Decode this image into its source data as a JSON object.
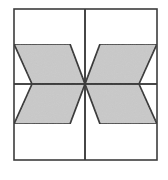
{
  "figure": {
    "background_color": "#ffffff",
    "frame": {
      "name": "square-border",
      "stroke_color": "#3c3c3c",
      "stroke_width": 1.6,
      "fill_color": "#ffffff",
      "left": 14,
      "top": 9,
      "right": 157,
      "bottom": 160
    },
    "grid": {
      "stroke_color": "#3c3c3c",
      "stroke_width": 1.6,
      "vertical_line_x": 85,
      "horizontal_line_y": 84
    },
    "center_point": {
      "x": 85,
      "y": 84
    },
    "shape_style": {
      "fill_color": "#c9c9c9",
      "stroke_color": "#2b2b2b",
      "stroke_width": 1.7
    },
    "shapes": [
      {
        "name": "parallelogram-top-left",
        "quadrant": "top-left",
        "points": "14,44 70,44 85,84 32,84"
      },
      {
        "name": "parallelogram-bottom-left",
        "quadrant": "bottom-left",
        "points": "32,84 85,84 70,124 14,124"
      },
      {
        "name": "parallelogram-top-right",
        "quadrant": "top-right",
        "points": "100,44 157,44 139,84 85,84"
      },
      {
        "name": "parallelogram-bottom-right",
        "quadrant": "bottom-right",
        "points": "85,84 139,84 157,124 100,124"
      }
    ]
  }
}
